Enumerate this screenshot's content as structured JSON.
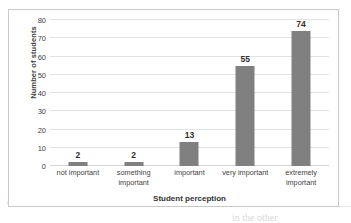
{
  "chart_data": {
    "type": "bar",
    "title": "",
    "subtitle": "",
    "xlabel": "Student perception",
    "ylabel": "Number of students",
    "categories": [
      "not important",
      "something important",
      "important",
      "very important",
      "extremely important"
    ],
    "category_lines": [
      [
        "not important"
      ],
      [
        "something",
        "important"
      ],
      [
        "important"
      ],
      [
        "very important"
      ],
      [
        "extremely",
        "important"
      ]
    ],
    "values": [
      2,
      2,
      13,
      55,
      74
    ],
    "data_labels": [
      "2",
      "2",
      "13",
      "55",
      "74"
    ],
    "ylim": [
      0,
      80
    ],
    "ytick_step": 10,
    "yticks": [
      "80",
      "70",
      "60",
      "50",
      "40",
      "30",
      "20",
      "10",
      "0"
    ],
    "grid": true,
    "legend": "none",
    "bar_color": "#808080",
    "gridline_color": "#e2e2e2",
    "plot_background": "#ffffff",
    "border_color": "#c9c9c9"
  },
  "page": {
    "artifact_a": "الصفحة مع النتائج السابقة",
    "artifact_b": "the students",
    "artifact_c": "in the other"
  }
}
